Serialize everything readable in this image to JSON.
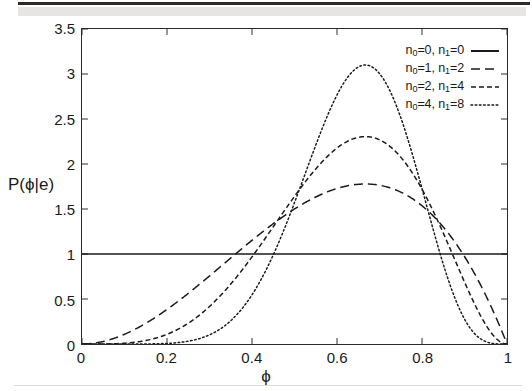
{
  "chart_data": {
    "type": "line",
    "title": "",
    "xlabel": "ϕ",
    "ylabel": "P(ϕ|e)",
    "xlim": [
      0,
      1
    ],
    "ylim": [
      0,
      3.5
    ],
    "grid": false,
    "legend_position": "top-right",
    "xticks": [
      "0",
      "0.2",
      "0.4",
      "0.6",
      "0.8",
      "1"
    ],
    "xtick_values": [
      0,
      0.2,
      0.4,
      0.6,
      0.8,
      1
    ],
    "yticks": [
      "0",
      "0.5",
      "1",
      "1.5",
      "2",
      "2.5",
      "3",
      "3.5"
    ],
    "ytick_values": [
      0,
      0.5,
      1,
      1.5,
      2,
      2.5,
      3,
      3.5
    ],
    "series": [
      {
        "name": "n0=0, n1=0",
        "n0": 0,
        "n1": 2,
        "style": "solid",
        "color": "#1a1a1a",
        "beta_a": 1,
        "beta_b": 1,
        "peak_x": null,
        "peak_y": 1.0,
        "x": [
          0,
          0.05,
          0.1,
          0.15,
          0.2,
          0.25,
          0.3,
          0.35,
          0.4,
          0.45,
          0.5,
          0.55,
          0.6,
          0.65,
          0.7,
          0.75,
          0.8,
          0.85,
          0.9,
          0.95,
          1
        ],
        "values": [
          1,
          1,
          1,
          1,
          1,
          1,
          1,
          1,
          1,
          1,
          1,
          1,
          1,
          1,
          1,
          1,
          1,
          1,
          1,
          1,
          1
        ]
      },
      {
        "name": "n0=1, n1=2",
        "n0": 1,
        "n1": 2,
        "style": "dashed",
        "color": "#1a1a1a",
        "beta_a": 3,
        "beta_b": 2,
        "peak_x": 0.667,
        "peak_y": 1.78,
        "x": [
          0,
          0.05,
          0.1,
          0.15,
          0.2,
          0.25,
          0.3,
          0.35,
          0.4,
          0.45,
          0.5,
          0.55,
          0.6,
          0.65,
          0.667,
          0.7,
          0.75,
          0.8,
          0.85,
          0.9,
          0.95,
          1
        ],
        "values": [
          0,
          0.029,
          0.108,
          0.229,
          0.384,
          0.563,
          0.756,
          0.956,
          1.152,
          1.336,
          1.5,
          1.634,
          1.728,
          1.775,
          1.778,
          1.764,
          1.688,
          1.536,
          1.301,
          0.972,
          0.541,
          0
        ]
      },
      {
        "name": "n0=2, n1=4",
        "n0": 2,
        "n1": 4,
        "style": "short-dash",
        "color": "#1a1a1a",
        "beta_a": 5,
        "beta_b": 3,
        "peak_x": 0.667,
        "peak_y": 2.3,
        "x": [
          0,
          0.05,
          0.1,
          0.15,
          0.2,
          0.25,
          0.3,
          0.35,
          0.4,
          0.45,
          0.5,
          0.55,
          0.6,
          0.65,
          0.667,
          0.7,
          0.75,
          0.8,
          0.85,
          0.9,
          0.95,
          1
        ],
        "values": [
          0,
          0.0005,
          0.0085,
          0.0364,
          0.0967,
          0.1968,
          0.3334,
          0.4985,
          0.6773,
          0.8517,
          1.0039,
          1.1195,
          1.1894,
          1.2113,
          1.2089,
          1.1897,
          1.1075,
          0.9667,
          0.7703,
          0.531,
          0.2741,
          0
        ]
      },
      {
        "name": "n0=4, n1=8",
        "n0": 4,
        "n1": 8,
        "style": "dotted",
        "color": "#1a1a1a",
        "beta_a": 9,
        "beta_b": 5,
        "peak_x": 0.667,
        "peak_y": 3.1,
        "x": [
          0,
          0.05,
          0.1,
          0.15,
          0.2,
          0.25,
          0.3,
          0.35,
          0.4,
          0.45,
          0.5,
          0.55,
          0.6,
          0.65,
          0.667,
          0.7,
          0.75,
          0.8,
          0.85,
          0.9,
          0.95,
          1
        ],
        "values": [
          0,
          0,
          0,
          0.0001,
          0.0013,
          0.0074,
          0.0273,
          0.0759,
          0.1713,
          0.3279,
          0.5493,
          0.8219,
          1.111,
          1.362,
          1.4283,
          1.5165,
          1.54,
          1.4156,
          1.124,
          0.7013,
          0.2646,
          0
        ]
      }
    ]
  },
  "axes": {
    "x_label": "ϕ",
    "y_label": "P(ϕ|e)",
    "x_ticks": [
      "0",
      "0.2",
      "0.4",
      "0.6",
      "0.8",
      "1"
    ],
    "y_ticks": [
      "3.5",
      "3",
      "2.5",
      "2",
      "1.5",
      "1",
      "0.5",
      "0"
    ]
  },
  "legend": {
    "entries": [
      {
        "n0": "0",
        "n1": "0",
        "style": "solid"
      },
      {
        "n0": "1",
        "n1": "2",
        "style": "dashed"
      },
      {
        "n0": "2",
        "n1": "4",
        "style": "short-dash"
      },
      {
        "n0": "4",
        "n1": "8",
        "style": "dotted"
      }
    ],
    "prefix_n0": "n",
    "prefix_n1": "n",
    "sub0": "0",
    "sub1": "1",
    "eq": "=",
    "sep": ", "
  },
  "colors": {
    "line": "#1a1a1a",
    "axis": "#2a2a2a",
    "background": "#ffffff",
    "artifact_bar": "#2b2b2b",
    "artifact_band": "#e2e0de"
  }
}
